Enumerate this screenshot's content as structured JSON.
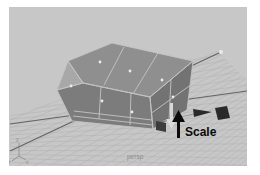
{
  "viewport": {
    "camera_label": "persp",
    "annotation": {
      "label": "Scale",
      "arrow_icon": "up-arrow"
    },
    "axis_gizmo": {
      "y": "y",
      "z": "z",
      "x": "x"
    },
    "manipulator": {
      "tool_label": "Scale",
      "x_handle_icon": "right-arrow-cube-handle",
      "y_handle_icon": "down-arrow-handle",
      "pivot_icon": "cube-handle"
    },
    "colors": {
      "page_bg": "#ffffff",
      "viewport_bg": "#c7c7c7",
      "grid_line": "#b3b3b3",
      "axis_line": "#636363",
      "box_top": "#8f8f8f",
      "box_front": "#7c7c7c",
      "box_left": "#a8a8a8",
      "box_right": "#737373",
      "wireframe": "#c4c4c4",
      "face_dot": "#ececec",
      "manipulator_dark": "#2a2a2a",
      "pivot_cube": "#3c3c3c",
      "light_arrow_fill": "#d9d9d9",
      "light_arrow_stroke": "#8f8f8f",
      "annotation_text": "#0b0b0b",
      "camera_label_color": "#8d8d8d",
      "gizmo_color": "#8a8a8a",
      "highlight_dot": "#eaeaea"
    }
  }
}
